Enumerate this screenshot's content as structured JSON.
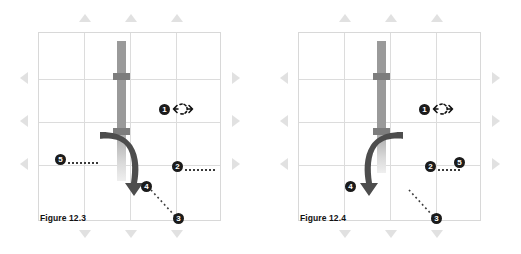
{
  "document": {
    "background_color": "#ffffff",
    "grid_line_color": "#dcdcdc",
    "rod_color": "#9a9a9a",
    "joint_color": "#7d7d7d",
    "arrow_color": "#4a4a4a",
    "callout_color": "#1b1b1b",
    "edge_marker_color": "#c9c9c9"
  },
  "figures": [
    {
      "id": "figure-12-3",
      "caption": "Figure 12.3",
      "orientation": "arrow-sweeps-right",
      "callouts": [
        {
          "number": "1",
          "label": "1",
          "icon": "rotation-arrows-icon",
          "has_leader": false
        },
        {
          "number": "2",
          "label": "2",
          "icon": "",
          "has_leader": true
        },
        {
          "number": "3",
          "label": "3",
          "icon": "",
          "has_leader": true
        },
        {
          "number": "4",
          "label": "4",
          "icon": "",
          "has_leader": false
        },
        {
          "number": "5",
          "label": "5",
          "icon": "",
          "has_leader": true
        }
      ]
    },
    {
      "id": "figure-12-4",
      "caption": "Figure 12.4",
      "orientation": "arrow-sweeps-left",
      "callouts": [
        {
          "number": "1",
          "label": "1",
          "icon": "rotation-arrows-icon",
          "has_leader": false
        },
        {
          "number": "2",
          "label": "2",
          "icon": "",
          "has_leader": true
        },
        {
          "number": "3",
          "label": "3",
          "icon": "",
          "has_leader": true
        },
        {
          "number": "4",
          "label": "4",
          "icon": "",
          "has_leader": false
        },
        {
          "number": "5",
          "label": "5",
          "icon": "",
          "has_leader": false
        }
      ]
    }
  ],
  "edge_markers": {
    "top_label": "up-triangle",
    "bottom_label": "down-triangle",
    "left_label": "left-triangle",
    "right_label": "right-triangle"
  }
}
